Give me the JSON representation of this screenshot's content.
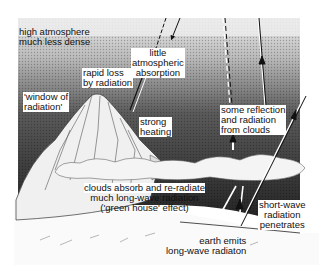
{
  "diagram": {
    "colors": {
      "sky_dark": "#1e1e1e",
      "sky_light": "#e6e6e6",
      "cloud": "#f2f2f2",
      "ground": "#fafafa",
      "text": "#111111"
    },
    "labels": {
      "high_atmosphere": [
        "high atmosphere",
        "much less dense"
      ],
      "little_absorption": [
        "little",
        "atmospheric",
        "absorption"
      ],
      "rapid_loss": [
        "rapid loss",
        "by radiation"
      ],
      "window": [
        "'window of",
        "radiation'"
      ],
      "strong_heating": [
        "strong",
        "heating"
      ],
      "reflection": [
        "some reflection",
        "and radiation",
        "from clouds"
      ],
      "clouds_absorb": [
        "clouds absorb and re-radiate",
        "much long-wave radiation",
        "('green house' effect)"
      ],
      "short_wave": [
        "short-wave",
        "radiation",
        "penetrates"
      ],
      "earth_emits": [
        "earth emits",
        "long-wave radiaton"
      ]
    },
    "arrows": [
      {
        "name": "incoming-solar-left",
        "style": "solid",
        "direction": "down"
      },
      {
        "name": "outgoing-dashed-left",
        "style": "dashed",
        "direction": "up"
      },
      {
        "name": "mountain-radiation-loss",
        "style": "double",
        "direction": "up"
      },
      {
        "name": "cloud-reflection-dashed",
        "style": "dashed",
        "direction": "up"
      },
      {
        "name": "cloud-reflection-solid",
        "style": "solid",
        "direction": "up"
      },
      {
        "name": "short-wave-incoming",
        "style": "solid",
        "direction": "down"
      },
      {
        "name": "earth-longwave-up",
        "style": "double",
        "direction": "up"
      }
    ]
  }
}
